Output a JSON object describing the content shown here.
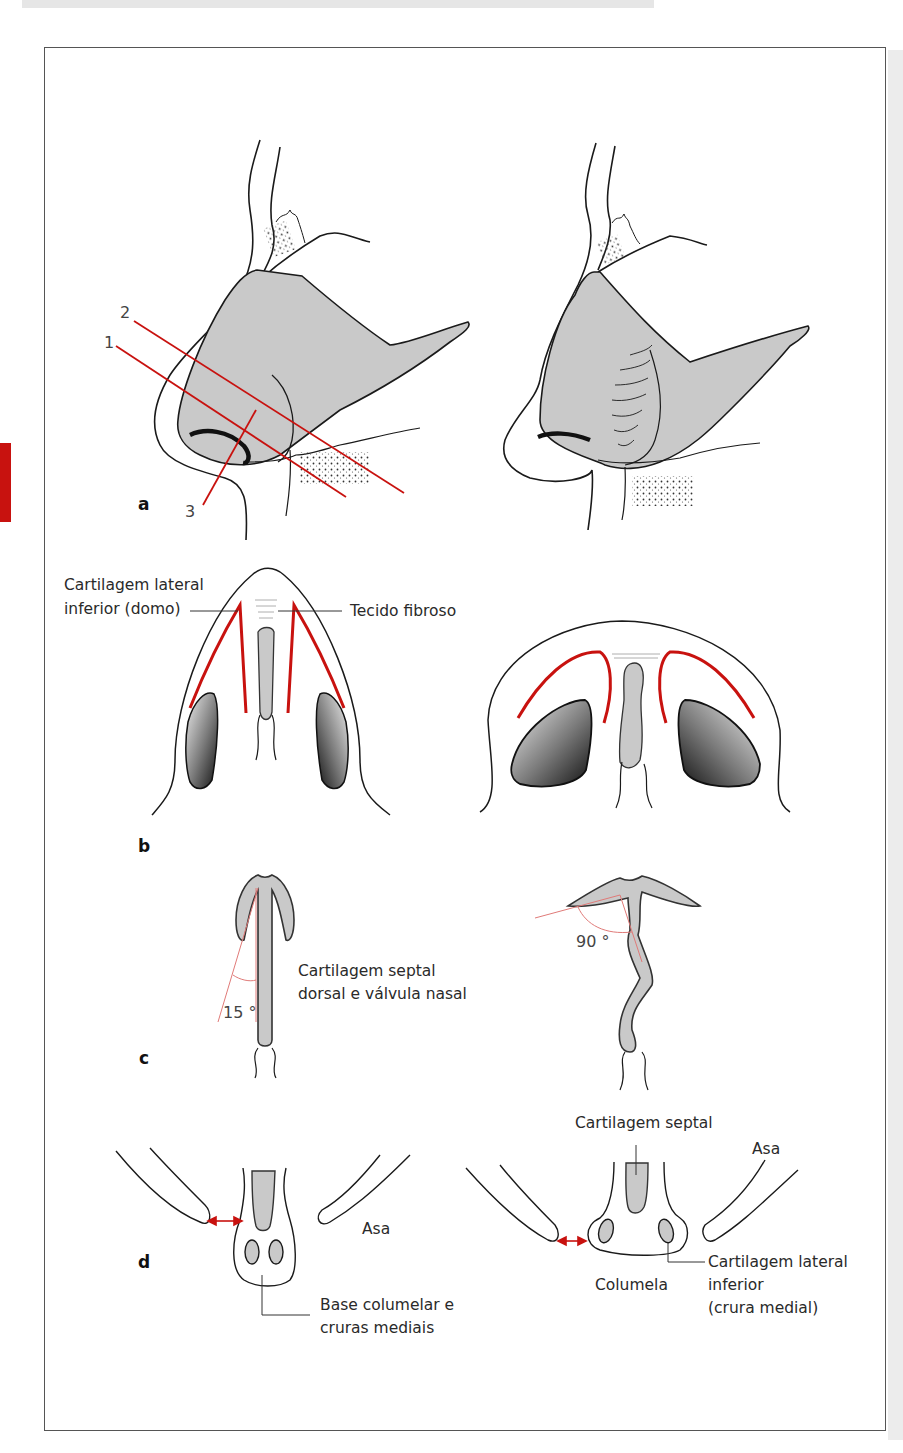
{
  "figure": {
    "panels": {
      "a": {
        "label": "a",
        "line_labels": [
          "1",
          "2",
          "3"
        ]
      },
      "b": {
        "label": "b",
        "callouts": {
          "dome": [
            "Cartilagem lateral",
            "inferior (domo)"
          ],
          "fibrous": "Tecido fibroso"
        }
      },
      "c": {
        "label": "c",
        "angle_left": "15 °",
        "angle_right": "90 °",
        "callout": [
          "Cartilagem septal",
          "dorsal e válvula nasal"
        ]
      },
      "d": {
        "label": "d",
        "left": {
          "asa": "Asa",
          "base": [
            "Base columelar e",
            "cruras mediais"
          ]
        },
        "right": {
          "septal": "Cartilagem septal",
          "asa": "Asa",
          "columela": "Columela",
          "lateral": [
            "Cartilagem lateral",
            "inferior",
            "(crura medial)"
          ]
        }
      }
    },
    "colors": {
      "accent_red": "#c8120f",
      "cartilage_gray": "#c9c9c9",
      "outline": "#1a1a1a",
      "frame": "#555555"
    }
  }
}
